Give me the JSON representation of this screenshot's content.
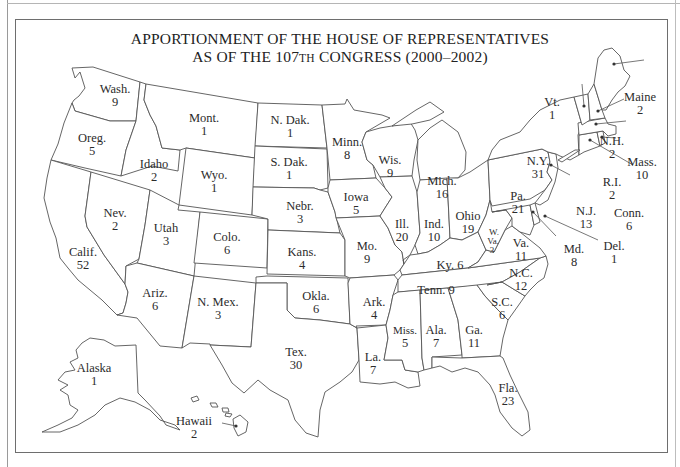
{
  "title": {
    "line1": "APPORTIONMENT OF THE HOUSE OF REPRESENTATIVES",
    "line2_prefix": "AS OF THE 107",
    "line2_ordinal": "TH",
    "line2_suffix": " CONGRESS (2000–2002)"
  },
  "states": [
    {
      "abbr": "Wash.",
      "seats": "9"
    },
    {
      "abbr": "Oreg.",
      "seats": "5"
    },
    {
      "abbr": "Calif.",
      "seats": "52"
    },
    {
      "abbr": "Idaho",
      "seats": "2"
    },
    {
      "abbr": "Nev.",
      "seats": "2"
    },
    {
      "abbr": "Mont.",
      "seats": "1"
    },
    {
      "abbr": "Wyo.",
      "seats": "1"
    },
    {
      "abbr": "Utah",
      "seats": "3"
    },
    {
      "abbr": "Colo.",
      "seats": "6"
    },
    {
      "abbr": "Ariz.",
      "seats": "6"
    },
    {
      "abbr": "N. Mex.",
      "seats": "3"
    },
    {
      "abbr": "N. Dak.",
      "seats": "1"
    },
    {
      "abbr": "S. Dak.",
      "seats": "1"
    },
    {
      "abbr": "Nebr.",
      "seats": "3"
    },
    {
      "abbr": "Kans.",
      "seats": "4"
    },
    {
      "abbr": "Okla.",
      "seats": "6"
    },
    {
      "abbr": "Tex.",
      "seats": "30"
    },
    {
      "abbr": "Minn.",
      "seats": "8"
    },
    {
      "abbr": "Iowa",
      "seats": "5"
    },
    {
      "abbr": "Mo.",
      "seats": "9"
    },
    {
      "abbr": "Ark.",
      "seats": "4"
    },
    {
      "abbr": "La.",
      "seats": "7"
    },
    {
      "abbr": "Wis.",
      "seats": "9"
    },
    {
      "abbr": "Ill.",
      "seats": "20"
    },
    {
      "abbr": "Mich.",
      "seats": "16"
    },
    {
      "abbr": "Ind.",
      "seats": "10"
    },
    {
      "abbr": "Ohio",
      "seats": "19"
    },
    {
      "abbr": "Ky.",
      "seats": "6"
    },
    {
      "abbr": "Tenn.",
      "seats": "9"
    },
    {
      "abbr": "Miss.",
      "seats": "5"
    },
    {
      "abbr": "Ala.",
      "seats": "7"
    },
    {
      "abbr": "Ga.",
      "seats": "11"
    },
    {
      "abbr": "Fla.",
      "seats": "23"
    },
    {
      "abbr": "S.C.",
      "seats": "6"
    },
    {
      "abbr": "N.C.",
      "seats": "12"
    },
    {
      "abbr": "Va.",
      "seats": "11"
    },
    {
      "abbr": "W. Va.",
      "seats": "3"
    },
    {
      "abbr": "Md.",
      "seats": "8"
    },
    {
      "abbr": "Del.",
      "seats": "1"
    },
    {
      "abbr": "Pa.",
      "seats": "21"
    },
    {
      "abbr": "N.J.",
      "seats": "13"
    },
    {
      "abbr": "N.Y.",
      "seats": "31"
    },
    {
      "abbr": "Conn.",
      "seats": "6"
    },
    {
      "abbr": "R.I.",
      "seats": "2"
    },
    {
      "abbr": "Mass.",
      "seats": "10"
    },
    {
      "abbr": "Vt.",
      "seats": "1"
    },
    {
      "abbr": "N.H.",
      "seats": "2"
    },
    {
      "abbr": "Maine",
      "seats": "2"
    },
    {
      "abbr": "Alaska",
      "seats": "1"
    },
    {
      "abbr": "Hawaii",
      "seats": "2"
    }
  ],
  "wva_parts": [
    "W.",
    "Va.",
    "3"
  ],
  "ky_label": "Ky. 6",
  "tenn_label": "Tenn. 9",
  "colors": {
    "stroke": "#555555",
    "text": "#2b2b2b",
    "background": "#ffffff"
  }
}
